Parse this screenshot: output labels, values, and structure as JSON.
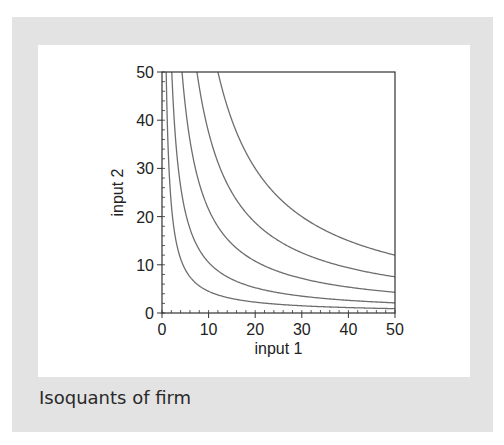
{
  "chart_data": {
    "type": "line",
    "title": "",
    "caption": "Isoquants of firm",
    "xlabel": "input 1",
    "ylabel": "input 2",
    "xlim": [
      0,
      50
    ],
    "ylim": [
      0,
      50
    ],
    "xticks": [
      0,
      10,
      20,
      30,
      40,
      50
    ],
    "yticks": [
      0,
      10,
      20,
      30,
      40,
      50
    ],
    "minor_tick_step": 2,
    "grid": false,
    "legend": null,
    "line_color": "#6e6e6e",
    "series": [
      {
        "name": "isoquant 1",
        "k": 45
      },
      {
        "name": "isoquant 2",
        "k": 105
      },
      {
        "name": "isoquant 3",
        "k": 215
      },
      {
        "name": "isoquant 4",
        "k": 375
      },
      {
        "name": "isoquant 5",
        "k": 600
      }
    ]
  }
}
